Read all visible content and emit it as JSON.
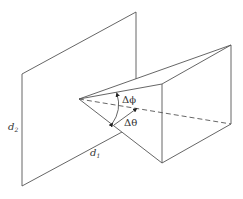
{
  "diagram": {
    "type": "geometry-illustration",
    "labels": {
      "d2": {
        "base": "d",
        "sub": "2"
      },
      "d1": {
        "base": "d",
        "sub": "1"
      },
      "delta_phi": "Δϕ",
      "delta_theta": "Δθ"
    },
    "colors": {
      "line": "#555555",
      "background": "#ffffff"
    }
  }
}
